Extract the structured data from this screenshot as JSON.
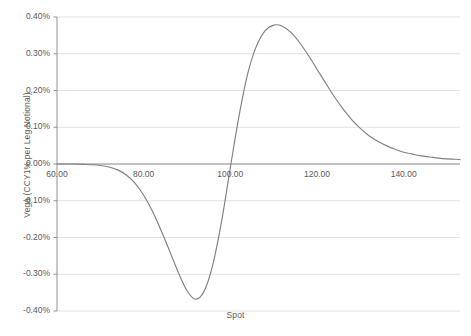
{
  "chart_data": {
    "type": "line",
    "title": "",
    "xlabel": "Spot",
    "ylabel": "Vega (CCY1% per Leg Notional)",
    "xlim": [
      60,
      153
    ],
    "ylim": [
      -0.4,
      0.4
    ],
    "y_unit": "%",
    "grid": true,
    "legend": "none",
    "line_color": "#808080",
    "axis_color": "#868686",
    "gridline_color": "#d9d9d9",
    "text_color": "#595959",
    "x_ticks": [
      "60.00",
      "80.00",
      "100.00",
      "120.00",
      "140.00"
    ],
    "x_tick_values": [
      60,
      80,
      100,
      120,
      140
    ],
    "y_ticks": [
      "0.40%",
      "0.30%",
      "0.20%",
      "0.10%",
      "0.00%",
      "-0.10%",
      "-0.20%",
      "-0.30%",
      "-0.40%"
    ],
    "y_tick_values": [
      0.4,
      0.3,
      0.2,
      0.1,
      0.0,
      -0.1,
      -0.2,
      -0.3,
      -0.4
    ],
    "series": [
      {
        "name": "Vega",
        "x": [
          60,
          62,
          64,
          66,
          68,
          70,
          72,
          74,
          76,
          78,
          80,
          82,
          84,
          86,
          88,
          90,
          92,
          94,
          96,
          98,
          100,
          102,
          104,
          106,
          108,
          110,
          112,
          114,
          116,
          118,
          120,
          122,
          124,
          126,
          128,
          130,
          132,
          134,
          136,
          138,
          140,
          142,
          144,
          146,
          148,
          150,
          152,
          153
        ],
        "y": [
          0.0,
          0.0,
          0.0,
          -0.001,
          -0.002,
          -0.004,
          -0.008,
          -0.016,
          -0.03,
          -0.052,
          -0.085,
          -0.128,
          -0.18,
          -0.237,
          -0.295,
          -0.345,
          -0.368,
          -0.345,
          -0.272,
          -0.155,
          -0.01,
          0.13,
          0.245,
          0.32,
          0.362,
          0.378,
          0.375,
          0.358,
          0.33,
          0.296,
          0.258,
          0.22,
          0.183,
          0.15,
          0.121,
          0.097,
          0.077,
          0.062,
          0.05,
          0.04,
          0.032,
          0.027,
          0.022,
          0.019,
          0.016,
          0.014,
          0.013,
          0.012
        ]
      }
    ]
  },
  "plot_area": {
    "left": 57,
    "right": 460,
    "top": 17,
    "bottom": 311,
    "zero_y": 164
  }
}
